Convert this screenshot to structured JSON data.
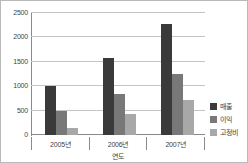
{
  "chart_data": {
    "type": "bar",
    "title": "",
    "xlabel": "연도",
    "ylabel": "",
    "categories": [
      "2005년",
      "2006년",
      "2007년"
    ],
    "series": [
      {
        "name": "매출",
        "color": "#3a3a3a",
        "values": [
          1000,
          1580,
          2280
        ]
      },
      {
        "name": "이익",
        "color": "#787878",
        "values": [
          490,
          850,
          1250
        ]
      },
      {
        "name": "고정비",
        "color": "#a8a8a8",
        "values": [
          150,
          440,
          710
        ]
      }
    ],
    "ylim": [
      0,
      2500
    ],
    "ytick_values": [
      0,
      500,
      1000,
      1500,
      2000,
      2500
    ],
    "ytick_labels": [
      "0",
      "500",
      "1000",
      "1500",
      "2000",
      "2500"
    ],
    "grid": true,
    "legend_position": "right"
  },
  "colors": {
    "grid": "#c4c4c4",
    "axis": "#8a8a8a",
    "frame": "#b9b9b9",
    "text": "#3f3f3f"
  }
}
